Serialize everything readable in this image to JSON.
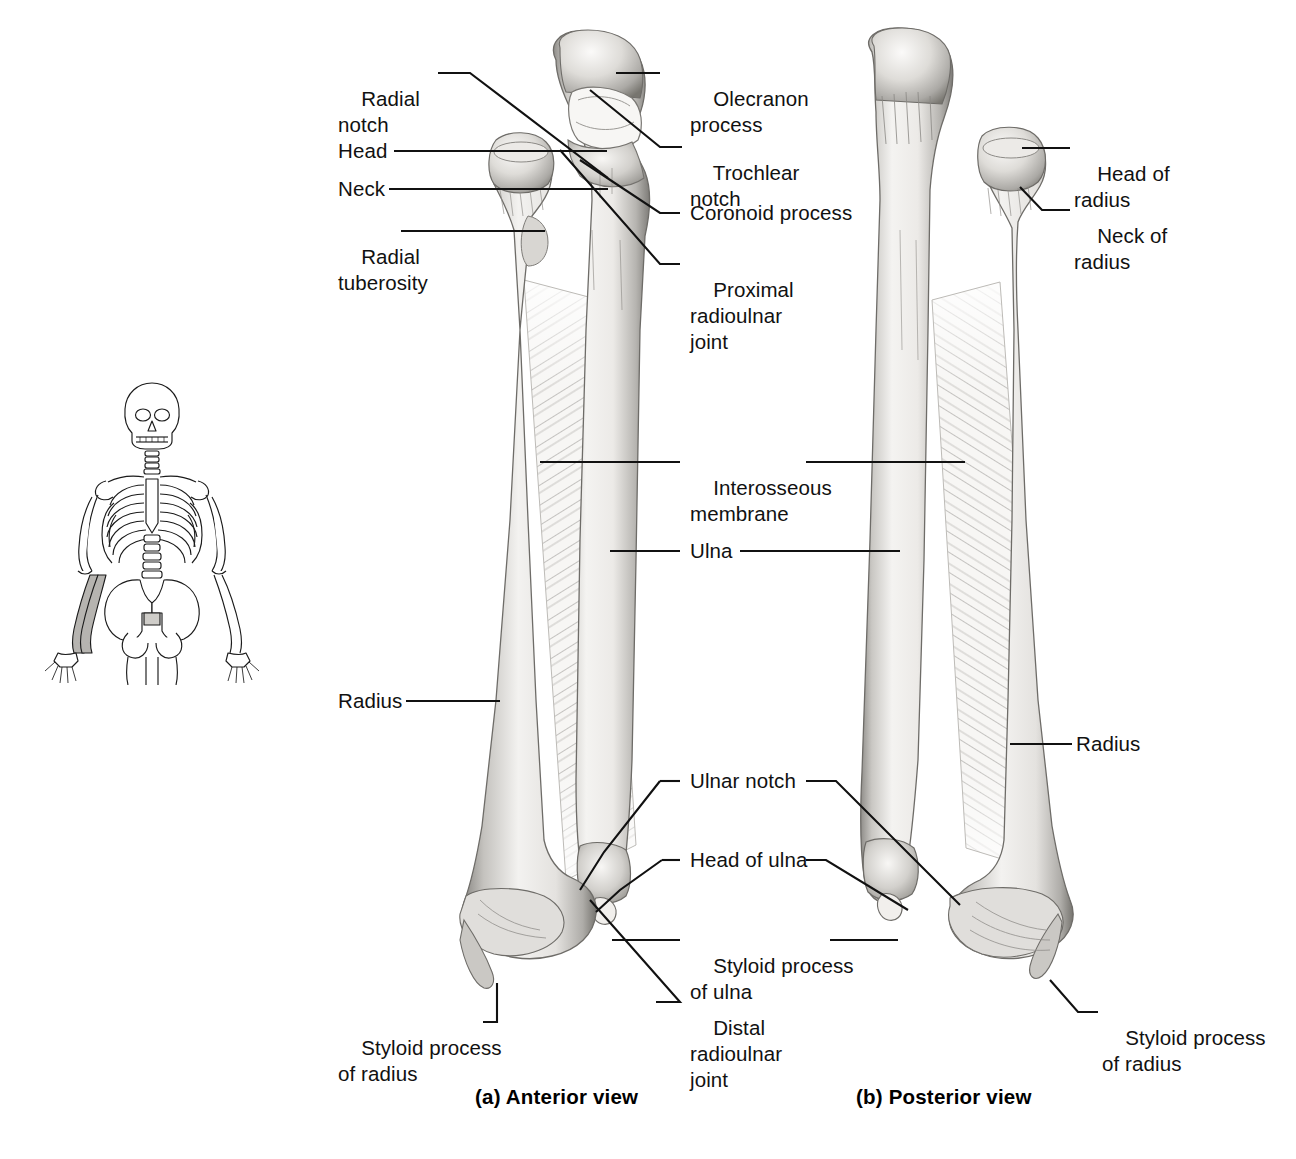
{
  "figure": {
    "background_color": "#ffffff",
    "ink_color": "#111111",
    "bone_light": "#f2f1ef",
    "bone_mid": "#c9c7c3",
    "bone_dark": "#8d8b87",
    "membrane_color": "#b9b7b3"
  },
  "orientation_figure": {
    "name": "skeleton-orientation-figure",
    "description": "anterior whole-skeleton line drawing with left forearm shaded",
    "highlight_region": "left forearm (radius and ulna)"
  },
  "panels": [
    {
      "id": "a",
      "caption": "(a) Anterior view"
    },
    {
      "id": "b",
      "caption": "(b) Posterior view"
    }
  ],
  "captions": {
    "anterior": "(a) Anterior view",
    "posterior": "(b) Posterior view"
  },
  "labels_left": [
    {
      "id": "radial-notch",
      "line1": "Radial",
      "line2": "notch"
    },
    {
      "id": "head",
      "line1": "Head",
      "line2": ""
    },
    {
      "id": "neck",
      "line1": "Neck",
      "line2": ""
    },
    {
      "id": "radial-tuberosity",
      "line1": "Radial",
      "line2": "tuberosity"
    },
    {
      "id": "radius-anterior",
      "line1": "Radius",
      "line2": ""
    },
    {
      "id": "styloid-process-of-radius-anterior",
      "line1": "Styloid process",
      "line2": "of radius"
    }
  ],
  "labels_center": [
    {
      "id": "olecranon-process",
      "line1": "Olecranon",
      "line2": "process",
      "line3": ""
    },
    {
      "id": "trochlear-notch",
      "line1": "Trochlear",
      "line2": "notch",
      "line3": ""
    },
    {
      "id": "coronoid-process",
      "line1": "Coronoid process",
      "line2": "",
      "line3": ""
    },
    {
      "id": "proximal-radioulnar-joint",
      "line1": "Proximal",
      "line2": "radioulnar",
      "line3": "joint"
    },
    {
      "id": "interosseous-membrane",
      "line1": "Interosseous",
      "line2": "membrane",
      "line3": ""
    },
    {
      "id": "ulna",
      "line1": "Ulna",
      "line2": "",
      "line3": ""
    },
    {
      "id": "ulnar-notch",
      "line1": "Ulnar notch",
      "line2": "",
      "line3": ""
    },
    {
      "id": "head-of-ulna",
      "line1": "Head of ulna",
      "line2": "",
      "line3": ""
    },
    {
      "id": "styloid-process-of-ulna",
      "line1": "Styloid process",
      "line2": "of ulna",
      "line3": ""
    },
    {
      "id": "distal-radioulnar-joint",
      "line1": "Distal",
      "line2": "radioulnar",
      "line3": "joint"
    }
  ],
  "labels_right": [
    {
      "id": "head-of-radius",
      "line1": "Head of",
      "line2": "radius"
    },
    {
      "id": "neck-of-radius",
      "line1": "Neck of",
      "line2": "radius"
    },
    {
      "id": "radius-posterior",
      "line1": "Radius",
      "line2": ""
    },
    {
      "id": "styloid-process-of-radius-posterior",
      "line1": "Styloid process",
      "line2": "of radius"
    }
  ],
  "structures": [
    "Radial notch",
    "Head",
    "Neck",
    "Radial tuberosity",
    "Olecranon process",
    "Trochlear notch",
    "Coronoid process",
    "Proximal radioulnar joint",
    "Interosseous membrane",
    "Ulna",
    "Radius",
    "Ulnar notch",
    "Head of ulna",
    "Styloid process of ulna",
    "Distal radioulnar joint",
    "Styloid process of radius",
    "Head of radius",
    "Neck of radius"
  ]
}
